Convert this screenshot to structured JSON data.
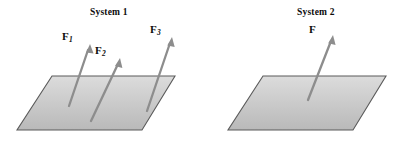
{
  "figure": {
    "type": "physics-diagram",
    "background_color": "#ffffff",
    "plane_fill_top": "#d8d8d8",
    "plane_fill_bottom": "#bcbcbc",
    "plane_stroke": "#555555",
    "arrow_color": "#8a8a8a",
    "text_color": "#0c0c0c"
  },
  "systems": [
    {
      "id": "system-1",
      "title": "System 1",
      "title_x": 110,
      "title_y": 13,
      "plane": {
        "points": "52,76 175,76 142,130 17,130",
        "top_left": [
          52,
          76
        ],
        "top_right": [
          175,
          76
        ],
        "bottom_right": [
          142,
          130
        ],
        "bottom_left": [
          17,
          130
        ]
      },
      "forces": [
        {
          "name": "F1",
          "label": "F",
          "subscript": "1",
          "label_x": 62,
          "label_y": 36,
          "tail_x": 69,
          "tail_y": 106,
          "tip_x": 90,
          "tip_y": 44
        },
        {
          "name": "F2",
          "label": "F",
          "subscript": "2",
          "label_x": 95,
          "label_y": 50,
          "tail_x": 91,
          "tail_y": 121,
          "tip_x": 120,
          "tip_y": 58
        },
        {
          "name": "F3",
          "label": "F",
          "subscript": "3",
          "label_x": 150,
          "label_y": 29,
          "tail_x": 147,
          "tail_y": 111,
          "tip_x": 172,
          "tip_y": 37
        }
      ]
    },
    {
      "id": "system-2",
      "title": "System 2",
      "title_x": 315,
      "title_y": 13,
      "plane": {
        "points": "263,76 386,76 353,130 228,130",
        "top_left": [
          263,
          76
        ],
        "top_right": [
          386,
          76
        ],
        "bottom_right": [
          353,
          130
        ],
        "bottom_left": [
          228,
          130
        ]
      },
      "forces": [
        {
          "name": "F",
          "label": "F",
          "subscript": "",
          "label_x": 309,
          "label_y": 29,
          "tail_x": 308,
          "tail_y": 100,
          "tip_x": 333,
          "tip_y": 35
        }
      ]
    }
  ]
}
